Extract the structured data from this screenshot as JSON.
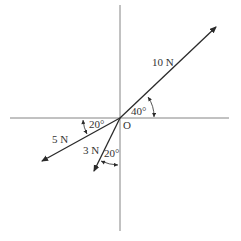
{
  "diagram": {
    "type": "force-diagram",
    "origin_label": "O",
    "forces": [
      {
        "id": "f10",
        "magnitude_label": "10 N",
        "angle_label": "40°",
        "reference": "positive x-axis",
        "direction": "up-right"
      },
      {
        "id": "f5",
        "magnitude_label": "5 N",
        "angle_label": "20°",
        "reference": "negative x-axis",
        "direction": "down-left"
      },
      {
        "id": "f3",
        "magnitude_label": "3 N",
        "angle_label": "20°",
        "reference": "negative y-axis",
        "direction": "down-left"
      }
    ],
    "colors": {
      "line": "#2a2a2a",
      "axis": "#555555",
      "text": "#333333",
      "background": "#ffffff"
    }
  }
}
